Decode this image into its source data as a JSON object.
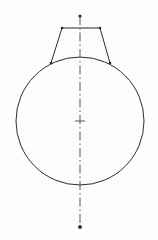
{
  "document": {
    "title": "Technical Drawing",
    "type": "engineering-line-drawing",
    "description": "Front view of a round vessel with a tapered neck"
  },
  "canvas": {
    "width": 158,
    "height": 240,
    "background_color": "#fdfdfd"
  },
  "style": {
    "outline_color": "#2b2b2b",
    "outline_width": 1,
    "centerline_color": "#555555",
    "centerline_width": 1,
    "centerline_dash": "9 3 1.5 3",
    "marker_color": "#2b2b2b"
  },
  "geometry": {
    "circle": {
      "name": "body-circle",
      "center_x": 80,
      "center_y": 121,
      "radius": 64,
      "left_x": 16,
      "right_x": 144,
      "top_y": 57,
      "bottom_y": 185
    },
    "neck": {
      "name": "neck-trapezoid",
      "top_left_x": 62,
      "top_left_y": 28,
      "top_right_x": 100,
      "top_right_y": 28,
      "bottom_left_x": 51,
      "bottom_left_y": 63,
      "bottom_right_x": 110,
      "bottom_right_y": 63,
      "top_width": 38,
      "bottom_width": 59
    },
    "centerline": {
      "name": "vertical-centerline",
      "x": 80,
      "start_y": 16,
      "end_y": 227
    },
    "center_mark": {
      "name": "center-cross",
      "x": 80,
      "y": 121,
      "arm_length": 5
    },
    "markers": [
      {
        "name": "centerline-top-dot",
        "x": 80,
        "y": 16,
        "radius": 1.6
      },
      {
        "name": "centerline-bottom-dot",
        "x": 80,
        "y": 227,
        "radius": 1.9
      },
      {
        "name": "neck-top-left-dot",
        "x": 62,
        "y": 28,
        "radius": 1.3
      },
      {
        "name": "neck-top-right-dot",
        "x": 100,
        "y": 28,
        "radius": 1.3
      },
      {
        "name": "neck-bottom-left-dot",
        "x": 51,
        "y": 63,
        "radius": 1.3
      },
      {
        "name": "neck-bottom-right-dot",
        "x": 110,
        "y": 63,
        "radius": 1.3
      }
    ]
  }
}
